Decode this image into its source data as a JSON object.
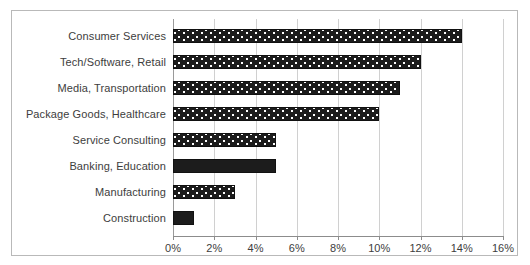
{
  "chart_data": {
    "type": "bar",
    "orientation": "horizontal",
    "title": "",
    "xlabel": "",
    "ylabel": "",
    "xlim": [
      0,
      16
    ],
    "xticks": [
      "0%",
      "2%",
      "4%",
      "6%",
      "8%",
      "10%",
      "12%",
      "14%",
      "16%"
    ],
    "xtick_values": [
      0,
      2,
      4,
      6,
      8,
      10,
      12,
      14,
      16
    ],
    "grid": true,
    "legend": false,
    "categories": [
      "Consumer Services",
      "Tech/Software, Retail",
      "Media, Transportation",
      "Package Goods, Healthcare",
      "Service Consulting",
      "Banking, Education",
      "Manufacturing",
      "Construction"
    ],
    "values": [
      14,
      12,
      11,
      10,
      5,
      5,
      3,
      1
    ],
    "value_labels": [
      "14%",
      "12%",
      "11%",
      "10%",
      "5%",
      "5%",
      "3%",
      "1%"
    ],
    "bar_fills": [
      "dotted",
      "dotted",
      "dotted",
      "dotted",
      "dotted",
      "solid",
      "dotted",
      "solid"
    ],
    "colors": {
      "bar": "#1c1c1c",
      "bar_border": "#111111",
      "bar_pattern": "#ffffff",
      "gridline": "#d0d0d0",
      "axis": "#8c8c8c",
      "frame": "#b9b9b9",
      "text": "#3d3d3d",
      "background": "#ffffff"
    }
  }
}
